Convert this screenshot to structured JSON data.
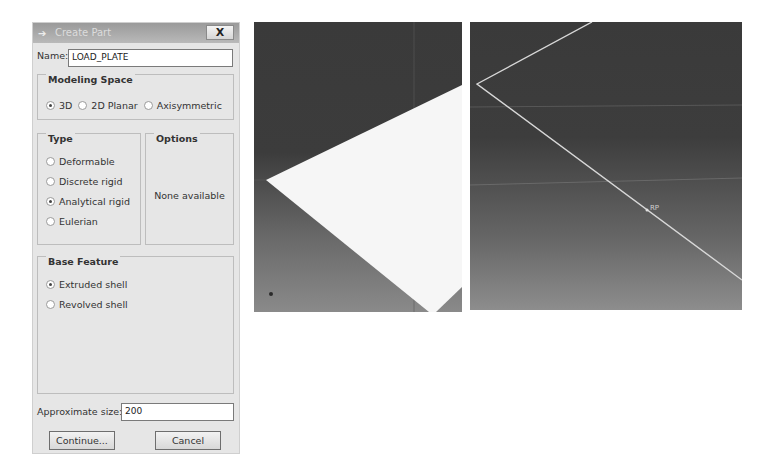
{
  "dialog": {
    "title": "Create Part",
    "close_label": "X",
    "name_label": "Name:",
    "name_value": "LOAD_PLATE",
    "modeling_space": {
      "title": "Modeling Space",
      "options": [
        {
          "label": "3D",
          "selected": true
        },
        {
          "label": "2D Planar",
          "selected": false
        },
        {
          "label": "Axisymmetric",
          "selected": false
        }
      ]
    },
    "type": {
      "title": "Type",
      "options": [
        {
          "label": "Deformable",
          "selected": false
        },
        {
          "label": "Discrete rigid",
          "selected": false
        },
        {
          "label": "Analytical rigid",
          "selected": true
        },
        {
          "label": "Eulerian",
          "selected": false
        }
      ]
    },
    "options_group": {
      "title": "Options",
      "message": "None available"
    },
    "base_feature": {
      "title": "Base Feature",
      "options": [
        {
          "label": "Extruded shell",
          "selected": true
        },
        {
          "label": "Revolved shell",
          "selected": false
        }
      ]
    },
    "approx_size_label": "Approximate size:",
    "approx_size_value": "200",
    "continue_label": "Continue...",
    "cancel_label": "Cancel"
  },
  "viewports": {
    "left": {
      "description": "shaded analytical rigid plate"
    },
    "right": {
      "description": "wireframe plate with reference point",
      "rp_label": "RP"
    }
  }
}
